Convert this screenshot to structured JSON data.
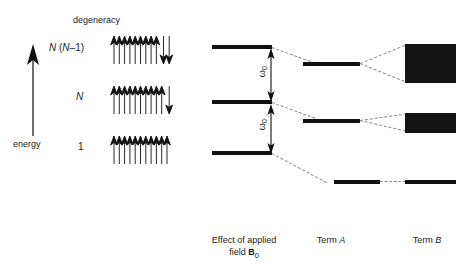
{
  "figure": {
    "type": "energy-level-splitting-diagram",
    "background": "#ffffff",
    "ink": "#111111",
    "dash_color": "#8a8a8a"
  },
  "axis": {
    "label": "energy",
    "direction": "up",
    "icon": "up-arrow-icon"
  },
  "degeneracy": {
    "header": "degeneracy",
    "rows": [
      {
        "label_html": "N (N–1)",
        "label": "N (N-1)",
        "spins_up": 9,
        "spins_down": 2
      },
      {
        "label_html": "N",
        "label": "N",
        "spins_up": 10,
        "spins_down": 1
      },
      {
        "label_html": "1",
        "label": "1",
        "spins_up": 11,
        "spins_down": 0
      }
    ]
  },
  "levels": {
    "field_column_label": "Effect of applied field B0",
    "items": [
      {
        "name": "upper",
        "degeneracy_ref": "N (N–1)"
      },
      {
        "name": "middle",
        "degeneracy_ref": "N"
      },
      {
        "name": "lower",
        "degeneracy_ref": "1"
      }
    ],
    "spacings": [
      {
        "label": "ω0",
        "between": [
          "upper",
          "middle"
        ]
      },
      {
        "label": "ω0",
        "between": [
          "middle",
          "lower"
        ]
      }
    ]
  },
  "columns": [
    {
      "id": "field",
      "caption_line1": "Effect of applied",
      "caption_line2_pre": "field ",
      "caption_line2_bold": "B",
      "caption_line2_sub": "0"
    },
    {
      "id": "termA",
      "caption_pre": "Term ",
      "caption_em": "A"
    },
    {
      "id": "termB",
      "caption_pre": "Term ",
      "caption_em": "B"
    }
  ],
  "termA": {
    "bars": [
      {
        "name": "termA-upper"
      },
      {
        "name": "termA-middle"
      },
      {
        "name": "termA-lower"
      }
    ]
  },
  "termB": {
    "bands": [
      {
        "name": "termB-upper-band",
        "style": "tall-filled-block"
      },
      {
        "name": "termB-middle-band",
        "style": "short-filled-block"
      },
      {
        "name": "termB-lower-line",
        "style": "thin-line"
      }
    ]
  },
  "connectors": {
    "description": "dashed lines linking field levels to Term A levels and Term A levels to Term B bands"
  }
}
